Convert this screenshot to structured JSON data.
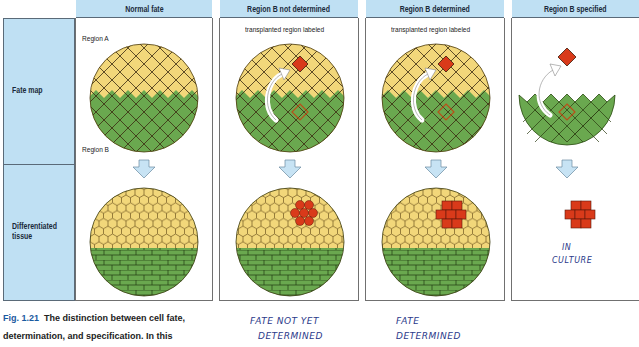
{
  "figure": {
    "number": "Fig. 1.21",
    "caption_bold": "The distinction between cell fate,",
    "caption_line2": "determination, and specification. In this"
  },
  "rows": [
    {
      "label": "Fate map"
    },
    {
      "label": "Differentiated tissue"
    }
  ],
  "row_labels": {
    "fate_map": "Fate map",
    "diff_line1": "Differentiated",
    "diff_line2": "tissue"
  },
  "columns": [
    {
      "header": "Normal fate",
      "top_label": "Region A",
      "bottom_label": "Region B"
    },
    {
      "header": "Region B not determined",
      "top_label": "transplanted region labeled"
    },
    {
      "header": "Region B determined",
      "top_label": "transplanted region labeled"
    },
    {
      "header": "Region B specified"
    }
  ],
  "handwritten_notes": {
    "not_determined_line1": "FATE NOT YET",
    "not_determined_line2": "DETERMINED",
    "determined_line1": "FATE",
    "determined_line2": "DETERMINED",
    "specified_line1": "IN",
    "specified_line2": "CULTURE"
  },
  "colors": {
    "header_bg": "#bfe0f3",
    "region_a_yellow": "#f2d77a",
    "region_b_green": "#6aa84f",
    "transplant_red": "#d93a1a",
    "arrow_blue": "#c7e3f4",
    "handwriting_blue": "#2b3a8a",
    "fig_label_blue": "#1a5aa0"
  }
}
